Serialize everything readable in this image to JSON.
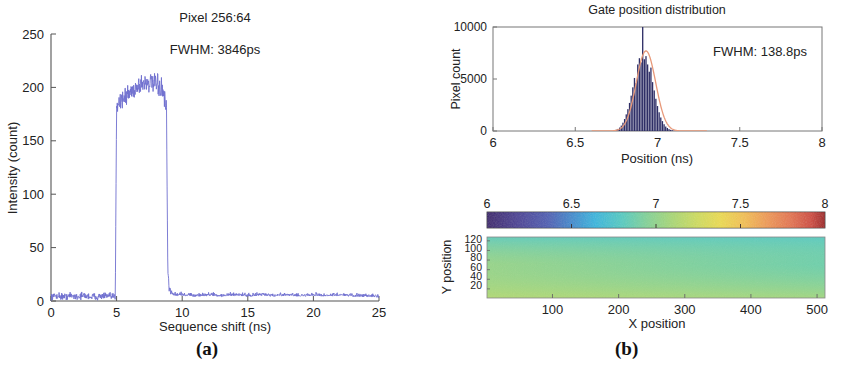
{
  "figure": {
    "caption_a": "(a)",
    "caption_b": "(b)"
  },
  "panel_a": {
    "title": "Pixel 256:64",
    "annotation": "FWHM: 3846ps",
    "xlabel": "Sequence shift (ns)",
    "ylabel": "Intensity (count)",
    "xticks": [
      "0",
      "5",
      "10",
      "15",
      "20",
      "25"
    ],
    "yticks": [
      "0",
      "50",
      "100",
      "150",
      "200",
      "250"
    ],
    "trace_color": "#6f6fcf"
  },
  "panel_b_hist": {
    "title": "Gate position distribution",
    "annotation": "FWHM: 138.8ps",
    "xlabel": "Position (ns)",
    "ylabel": "Pixel count",
    "xticks": [
      "6",
      "6.5",
      "7",
      "7.5",
      "8"
    ],
    "yticks": [
      "0",
      "5000",
      "10000"
    ],
    "bar_color": "#2e2e66",
    "fit_color": "#e8997a"
  },
  "panel_b_map": {
    "xlabel": "X position",
    "ylabel": "Y position",
    "xticks": [
      "100",
      "200",
      "300",
      "400",
      "500"
    ],
    "yticks": [
      "120",
      "100",
      "80",
      "60",
      "40",
      "20"
    ],
    "colorbar_ticks": [
      "6",
      "6.5",
      "7",
      "7.5",
      "8"
    ]
  },
  "chart_data": [
    {
      "type": "line",
      "id": "panel-a-gate-scan",
      "title": "Pixel 256:64",
      "subtitle": "FWHM: 3846ps",
      "xlabel": "Sequence shift (ns)",
      "ylabel": "Intensity (count)",
      "xlim": [
        0,
        25
      ],
      "ylim": [
        0,
        250
      ],
      "xticks": [
        0,
        5,
        10,
        15,
        20,
        25
      ],
      "yticks": [
        0,
        50,
        100,
        150,
        200,
        250
      ],
      "grid": false,
      "legend": null,
      "series": [
        {
          "name": "Intensity",
          "color": "#6f6fcf",
          "description": "Flat noise baseline near 4 counts, sharp rise at 5.0 ns to ~185, domed plateau peaking ~205 near 7.3 ns, sharp fall at 8.9 ns back to ~4 counts",
          "x": [
            0.0,
            0.5,
            1.0,
            1.5,
            2.0,
            2.5,
            3.0,
            3.5,
            4.0,
            4.5,
            4.9,
            5.0,
            5.2,
            5.5,
            5.8,
            6.1,
            6.4,
            6.7,
            7.0,
            7.3,
            7.6,
            7.9,
            8.2,
            8.5,
            8.8,
            8.9,
            9.0,
            9.2,
            9.5,
            10.0,
            11.0,
            12.0,
            13.0,
            14.0,
            15.0,
            16.0,
            17.0,
            18.0,
            19.0,
            20.0,
            21.0,
            22.0,
            23.0,
            24.0,
            25.0
          ],
          "y": [
            4,
            5,
            4,
            5,
            4,
            5,
            4,
            4,
            5,
            4,
            4,
            185,
            186,
            190,
            193,
            196,
            199,
            202,
            204,
            205,
            204,
            203,
            201,
            197,
            180,
            30,
            12,
            7,
            5,
            5,
            4,
            5,
            4,
            5,
            4,
            5,
            4,
            5,
            4,
            5,
            4,
            5,
            4,
            4,
            3
          ],
          "noise_amplitude": 4
        }
      ]
    },
    {
      "type": "bar",
      "id": "panel-b-gate-position-histogram",
      "title": "Gate position distribution",
      "subtitle": "FWHM: 138.8ps",
      "xlabel": "Position (ns)",
      "ylabel": "Pixel count",
      "xlim": [
        6,
        8
      ],
      "ylim": [
        0,
        10000
      ],
      "xticks": [
        6,
        6.5,
        7,
        7.5,
        8
      ],
      "yticks": [
        0,
        5000,
        10000
      ],
      "grid": false,
      "bar_color": "#2e2e66",
      "bin_width": 0.008,
      "categories": [
        6.74,
        6.75,
        6.76,
        6.77,
        6.78,
        6.79,
        6.8,
        6.81,
        6.82,
        6.83,
        6.84,
        6.85,
        6.86,
        6.87,
        6.88,
        6.89,
        6.9,
        6.91,
        6.92,
        6.93,
        6.94,
        6.95,
        6.96,
        6.97,
        6.98,
        6.99,
        7.0,
        7.01,
        7.02,
        7.03,
        7.04,
        7.05,
        7.06,
        7.07,
        7.08,
        7.09,
        7.1,
        7.11
      ],
      "values": [
        60,
        120,
        200,
        330,
        520,
        800,
        1150,
        1600,
        2100,
        2700,
        3400,
        4200,
        5100,
        4600,
        6400,
        7000,
        6600,
        10000,
        6900,
        7200,
        6400,
        5700,
        6100,
        4700,
        3900,
        3100,
        2400,
        1800,
        1300,
        950,
        650,
        430,
        290,
        180,
        110,
        70,
        40,
        20
      ],
      "overlays": [
        {
          "name": "Gaussian fit",
          "type": "line",
          "color": "#e8997a",
          "mean": 6.93,
          "amplitude": 7700,
          "fwhm_ns": 0.1388,
          "fwhm_label": "138.8ps"
        }
      ]
    },
    {
      "type": "heatmap",
      "id": "panel-b-gate-position-map",
      "xlabel": "X position",
      "ylabel": "Y position",
      "xlim": [
        1,
        512
      ],
      "ylim": [
        1,
        128
      ],
      "xticks": [
        100,
        200,
        300,
        400,
        500
      ],
      "yticks": [
        20,
        40,
        60,
        80,
        100,
        120
      ],
      "colormap": "jet",
      "colorbar": {
        "orientation": "horizontal",
        "position": "above",
        "min": 6,
        "max": 8,
        "ticks": [
          6,
          6.5,
          7,
          7.5,
          8
        ],
        "unit": "ns"
      },
      "value_range_shown": [
        6.84,
        7.02
      ],
      "description": "Near-uniform gate position across the 512x128 array; smooth gradient from yellow-green (~6.86 ns) at bottom-left to teal/cyan (~7.00 ns) at top-right, with fine pixel-to-pixel noise",
      "corner_values": {
        "top_left": 6.95,
        "top_right": 7.01,
        "bottom_left": 6.86,
        "bottom_right": 6.93
      }
    }
  ]
}
